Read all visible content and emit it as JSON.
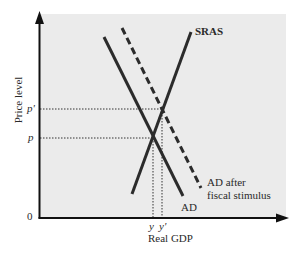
{
  "diagram": {
    "title": "",
    "axes": {
      "x_label": "Real GDP",
      "y_label": "Price level",
      "origin_label": "0"
    },
    "curves": {
      "sras": {
        "label": "SRAS",
        "style": "solid"
      },
      "ad": {
        "label": "AD",
        "style": "solid"
      },
      "ad_after": {
        "label_line1": "AD after",
        "label_line2": "fiscal stimulus",
        "style": "dashed"
      }
    },
    "equilibria": {
      "initial": {
        "price_label": "p",
        "output_label": "y"
      },
      "new": {
        "price_label": "p'",
        "output_label": "y'"
      }
    },
    "colors": {
      "plot_background": "#ebebeb",
      "line": "#2b2b2b",
      "axis": "#111111"
    }
  }
}
